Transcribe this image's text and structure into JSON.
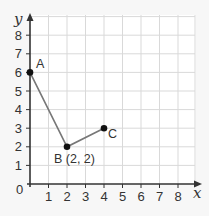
{
  "chart_data": {
    "type": "line",
    "title": "",
    "xlabel": "x",
    "ylabel": "y",
    "xlim": [
      0,
      8.5
    ],
    "ylim": [
      0,
      8.5
    ],
    "grid": true,
    "x_ticks": [
      "1",
      "2",
      "3",
      "4",
      "5",
      "6",
      "7",
      "8"
    ],
    "y_ticks": [
      "1",
      "2",
      "3",
      "4",
      "5",
      "6",
      "7",
      "8"
    ],
    "origin_label": "0",
    "series": [
      {
        "name": "ABC",
        "points": [
          {
            "label": "A",
            "x": 0,
            "y": 6
          },
          {
            "label": "B (2, 2)",
            "x": 2,
            "y": 2
          },
          {
            "label": "C",
            "x": 4,
            "y": 3
          }
        ]
      }
    ],
    "colors": {
      "grid": "#d9d9d9",
      "axis": "#333333",
      "line": "#777777",
      "point": "#111111"
    }
  }
}
